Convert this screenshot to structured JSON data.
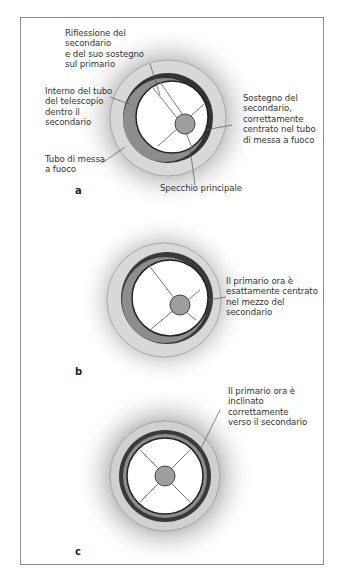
{
  "figure": {
    "panels": [
      {
        "letter": "a",
        "labels": {
          "reflection": "Riflessione del\nsecondario\ne del suo sostegno\nsul primario",
          "tube_interior": "Interno del tubo\ndel telescopio\ndentro il\nsecondario",
          "focuser_tube": "Tubo di messa\na fuoco",
          "spider": "Sostegno del\nsecondario,\ncorrettamente\ncentrato nel tubo\ndi messa a fuoco",
          "primary_mirror": "Specchio principale"
        }
      },
      {
        "letter": "b",
        "labels": {
          "centered": "Il primario ora è\nesattamente centrato\nnel mezzo del\nsecondario"
        }
      },
      {
        "letter": "c",
        "labels": {
          "tilted": "Il primario ora è\ninclinato\ncorrettamente\nverso il secondario"
        }
      }
    ],
    "colors": {
      "frame": "#8a8a8a",
      "halo": "#9a9a9a",
      "outer_ring": "#d6d6d6",
      "dark_ring": "#3a3a3a",
      "mid_ring": "#8c8c8c",
      "mirror": "#ffffff",
      "secondary": "#9e9e9e",
      "lines": "#6a6a6a"
    }
  }
}
